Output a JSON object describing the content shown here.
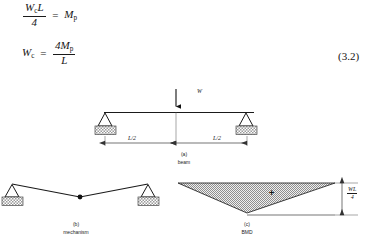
{
  "equations": {
    "eq1": {
      "lhs_numerator": "W",
      "lhs_num_sub": "c",
      "lhs_num_tail": "L",
      "lhs_denominator": "4",
      "relation": "=",
      "rhs": "M",
      "rhs_sub": "p",
      "plain": "Wc L / 4 = Mp"
    },
    "eq2": {
      "lhs": "W",
      "lhs_sub": "c",
      "relation": "=",
      "rhs_numerator": "4M",
      "rhs_num_sub": "p",
      "rhs_denominator": "L",
      "plain": "Wc = 4Mp / L"
    },
    "number": "(3.2)"
  },
  "figures": {
    "beam": {
      "caption_letter": "(a)",
      "caption_name": "beam",
      "load_label": "W",
      "dim_left_label": "L/2",
      "dim_right_label": "L/2"
    },
    "mechanism": {
      "caption_letter": "(b)",
      "caption_name": "mechanism"
    },
    "bmd": {
      "caption_letter": "(c)",
      "caption_name": "BMD",
      "sign_label": "+",
      "moment_numerator": "WL",
      "moment_denominator": "4",
      "moment_plain": "WL/4"
    }
  },
  "colors": {
    "ink": "#1a1a1a",
    "page_background": "#ffffff",
    "hatch_fill": "#b9b9b9",
    "support_base_fill": "#c9c9c9"
  }
}
